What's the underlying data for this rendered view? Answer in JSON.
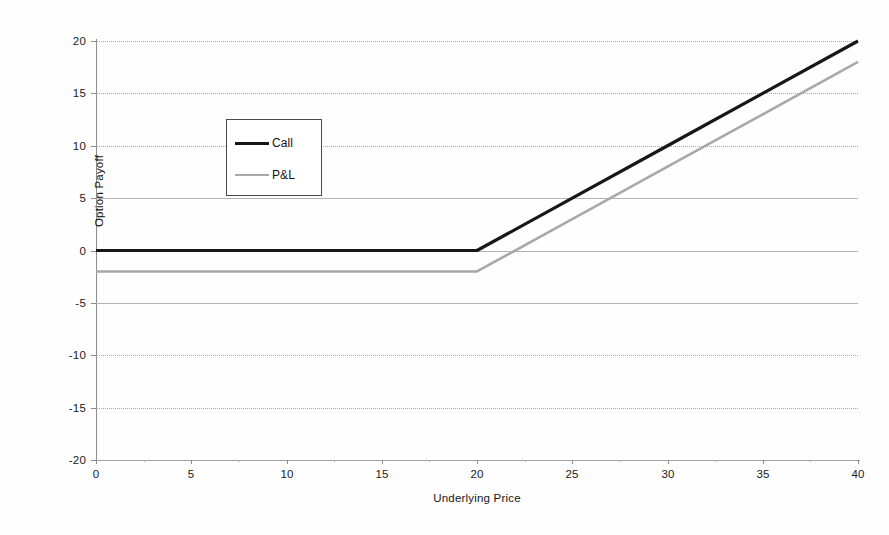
{
  "chart_data": {
    "type": "line",
    "title": "",
    "xlabel": "Underlying Price",
    "ylabel": "Option Payoff",
    "xlim": [
      0,
      40
    ],
    "ylim": [
      -20,
      20
    ],
    "xticks": [
      0,
      5,
      10,
      15,
      20,
      25,
      30,
      35,
      40
    ],
    "yticks": [
      20,
      15,
      10,
      5,
      0,
      -5,
      -10,
      -15,
      -20
    ],
    "xtick_labels": [
      "0",
      "5",
      "10",
      "15",
      "20",
      "25",
      "30",
      "35",
      "40"
    ],
    "ytick_labels": [
      "20",
      "15",
      "10",
      "5",
      "0",
      "-5",
      "-10",
      "-15",
      "-20"
    ],
    "grid": true,
    "grid_axis": "y",
    "legend_position": "upper left",
    "strike": 20,
    "premium": 2,
    "x": [
      0,
      5,
      10,
      15,
      20,
      25,
      30,
      35,
      40
    ],
    "series": [
      {
        "name": "Call",
        "color": "#171717",
        "linewidth": 3.2,
        "values": [
          0,
          0,
          0,
          0,
          0,
          5,
          10,
          15,
          20
        ]
      },
      {
        "name": "P&L",
        "color": "#a8a8a8",
        "linewidth": 2.6,
        "values": [
          -2,
          -2,
          -2,
          -2,
          -2,
          3,
          8,
          13,
          18
        ]
      }
    ]
  },
  "axes": {
    "ylabel": "Option Payoff",
    "xlabel": "Underlying Price",
    "ytick_labels": [
      "20",
      "15",
      "10",
      "5",
      "0",
      "-5",
      "-10",
      "-15",
      "-20"
    ],
    "xtick_labels": [
      "0",
      "5",
      "10",
      "15",
      "20",
      "25",
      "30",
      "35",
      "40"
    ]
  },
  "legend": {
    "entries": [
      {
        "label": "Call",
        "color": "#171717"
      },
      {
        "label": "P&L",
        "color": "#a8a8a8"
      }
    ]
  },
  "colors": {
    "background": "#fefefe",
    "axis": "#8c8c8c",
    "grid": "#a8a8a8",
    "call_line": "#171717",
    "pl_line": "#a8a8a8",
    "legend_border": "#4a4a4a",
    "text": "#1a1a1a"
  }
}
